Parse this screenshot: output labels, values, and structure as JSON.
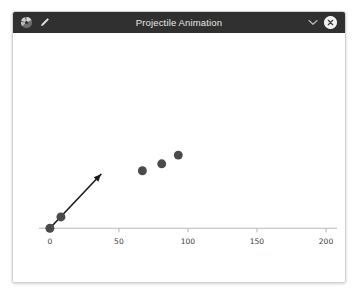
{
  "window": {
    "title": "Projectile Animation",
    "titlebar_color": "#303030",
    "titlebar_text_color": "#e8e8e8",
    "background_color": "#ffffff",
    "border_color": "#d2d2d2"
  },
  "titlebar": {
    "app_icon": "matplotlib-logo-icon",
    "edit_icon": "pencil-icon",
    "collapse_icon": "chevron-down-icon",
    "close_icon": "close-icon"
  },
  "chart_data": {
    "type": "scatter",
    "title": "",
    "xlabel": "",
    "ylabel": "",
    "xlim": [
      -8,
      208
    ],
    "ylim": [
      0,
      95
    ],
    "xticks": [
      0,
      50,
      100,
      150,
      200
    ],
    "xtick_labels": [
      "0",
      "50",
      "100",
      "150",
      "200"
    ],
    "yticks": [],
    "ytick_labels": [],
    "grid": false,
    "legend": null,
    "axis_color": "#b8b8b8",
    "marker_color": "#4a4a4a",
    "marker_size": 9,
    "series": [
      {
        "name": "projectile",
        "x": [
          0,
          8,
          67,
          81,
          93
        ],
        "y": [
          0,
          6.5,
          33,
          37,
          42
        ]
      }
    ],
    "annotations": [
      {
        "type": "arrow",
        "name": "velocity-vector",
        "x0": 0,
        "y0": 0,
        "x1": 37,
        "y1": 31,
        "color": "#1a1a1a",
        "linewidth": 1.6
      }
    ]
  }
}
